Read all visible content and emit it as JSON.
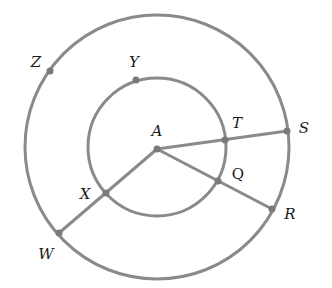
{
  "diagram": {
    "type": "concentric-circles",
    "stroke_color": "#8a8a8a",
    "stroke_width": 3,
    "center": {
      "name": "A",
      "x": 157,
      "y": 149
    },
    "outer_circle": {
      "cx": 157,
      "cy": 147,
      "r": 132
    },
    "inner_circle": {
      "cx": 157,
      "cy": 147,
      "r": 69
    },
    "points": [
      {
        "name": "A",
        "x": 157,
        "y": 149,
        "label_x": 157,
        "label_y": 131
      },
      {
        "name": "Y",
        "x": 136,
        "y": 80,
        "label_x": 134,
        "label_y": 62
      },
      {
        "name": "Z",
        "x": 50,
        "y": 71,
        "label_x": 36,
        "label_y": 62
      },
      {
        "name": "T",
        "x": 225,
        "y": 140,
        "label_x": 237,
        "label_y": 123
      },
      {
        "name": "S",
        "x": 287,
        "y": 131,
        "label_x": 304,
        "label_y": 128
      },
      {
        "name": "Q",
        "x": 218,
        "y": 181,
        "label_x": 238,
        "label_y": 174
      },
      {
        "name": "R",
        "x": 272,
        "y": 209,
        "label_x": 290,
        "label_y": 214
      },
      {
        "name": "X",
        "x": 106,
        "y": 193,
        "label_x": 85,
        "label_y": 194
      },
      {
        "name": "W",
        "x": 59,
        "y": 233,
        "label_x": 46,
        "label_y": 254
      }
    ],
    "segments": [
      {
        "from": "A",
        "to": "S",
        "passes_through": "T"
      },
      {
        "from": "A",
        "to": "R",
        "passes_through": "Q"
      },
      {
        "from": "A",
        "to": "W",
        "passes_through": "X"
      }
    ],
    "labels": {
      "A": "A",
      "Y": "Y",
      "Z": "Z",
      "T": "T",
      "S": "S",
      "Q": "Q",
      "R": "R",
      "X": "X",
      "W": "W"
    }
  }
}
